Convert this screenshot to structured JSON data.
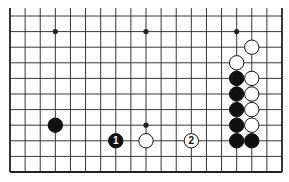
{
  "diagram": {
    "type": "go-board-partial",
    "board_size": 19,
    "visible_columns": [
      1,
      19
    ],
    "visible_rows": [
      1,
      11
    ],
    "edges": {
      "left": true,
      "right": true,
      "bottom": true,
      "top": false
    },
    "geometry": {
      "left_x": 10,
      "right_x": 282,
      "bottom_y": 172,
      "row_spacing": 15.6,
      "top_extend_y": 8
    },
    "colors": {
      "background": "#ffffff",
      "line": "#222222",
      "black_stone": "#111111",
      "white_stone": "#ffffff",
      "stone_outline": "#111111"
    },
    "star_points": [
      {
        "col": 4,
        "row": 10
      },
      {
        "col": 10,
        "row": 10
      },
      {
        "col": 16,
        "row": 10
      },
      {
        "col": 10,
        "row": 4
      }
    ],
    "stones": [
      {
        "color": "black",
        "col": 4,
        "row": 4,
        "label": ""
      },
      {
        "color": "black",
        "col": 8,
        "row": 3,
        "label": "1"
      },
      {
        "color": "white",
        "col": 10,
        "row": 3,
        "label": ""
      },
      {
        "color": "white",
        "col": 13,
        "row": 3,
        "label": "2"
      },
      {
        "color": "white",
        "col": 17,
        "row": 9,
        "label": ""
      },
      {
        "color": "white",
        "col": 16,
        "row": 8,
        "label": ""
      },
      {
        "color": "black",
        "col": 16,
        "row": 7,
        "label": ""
      },
      {
        "color": "black",
        "col": 16,
        "row": 6,
        "label": ""
      },
      {
        "color": "black",
        "col": 16,
        "row": 5,
        "label": ""
      },
      {
        "color": "black",
        "col": 16,
        "row": 4,
        "label": ""
      },
      {
        "color": "black",
        "col": 16,
        "row": 3,
        "label": ""
      },
      {
        "color": "white",
        "col": 17,
        "row": 7,
        "label": ""
      },
      {
        "color": "white",
        "col": 17,
        "row": 6,
        "label": ""
      },
      {
        "color": "white",
        "col": 17,
        "row": 5,
        "label": ""
      },
      {
        "color": "white",
        "col": 17,
        "row": 4,
        "label": ""
      },
      {
        "color": "black",
        "col": 17,
        "row": 3,
        "label": ""
      }
    ]
  }
}
